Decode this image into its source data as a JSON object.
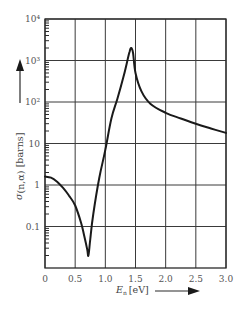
{
  "chart_data": {
    "type": "line",
    "title": "",
    "xlabel": "E_n [eV]",
    "ylabel": "σ_(n,α) [barns]",
    "x_label_symbol": "E",
    "x_label_subscript": "n",
    "x_label_unit": "[eV]",
    "y_label_symbol": "σ",
    "y_label_subscript": "(n,α)",
    "y_label_unit": "[barns]",
    "xlim": [
      0,
      3.0
    ],
    "ylim": [
      0.01,
      10000
    ],
    "yscale": "log",
    "grid": true,
    "x_ticks": [
      "0",
      "0.5",
      "1.0",
      "1.5",
      "2.0",
      "2.5",
      "3.0"
    ],
    "x_tick_values": [
      0,
      0.5,
      1.0,
      1.5,
      2.0,
      2.5,
      3.0
    ],
    "y_ticks": [
      "0.1",
      "1",
      "10",
      "10²",
      "10³",
      "10⁴"
    ],
    "y_tick_values": [
      0.1,
      1,
      10,
      100,
      1000,
      10000
    ],
    "series": [
      {
        "name": "cross section",
        "x": [
          0.0,
          0.1,
          0.2,
          0.3,
          0.4,
          0.5,
          0.6,
          0.65,
          0.7,
          0.72,
          0.75,
          0.8,
          0.9,
          1.0,
          1.1,
          1.2,
          1.3,
          1.35,
          1.4,
          1.43,
          1.46,
          1.5,
          1.6,
          1.75,
          2.0,
          2.25,
          2.5,
          2.75,
          3.0
        ],
        "values": [
          1.6,
          1.5,
          1.2,
          0.85,
          0.55,
          0.32,
          0.12,
          0.06,
          0.028,
          0.02,
          0.05,
          0.2,
          1.5,
          7,
          40,
          120,
          400,
          800,
          1600,
          2000,
          1500,
          500,
          180,
          90,
          55,
          40,
          30,
          23,
          18
        ]
      }
    ],
    "annotations": [
      "arrow pointing up beside y label",
      "arrow pointing right beside x label"
    ]
  }
}
